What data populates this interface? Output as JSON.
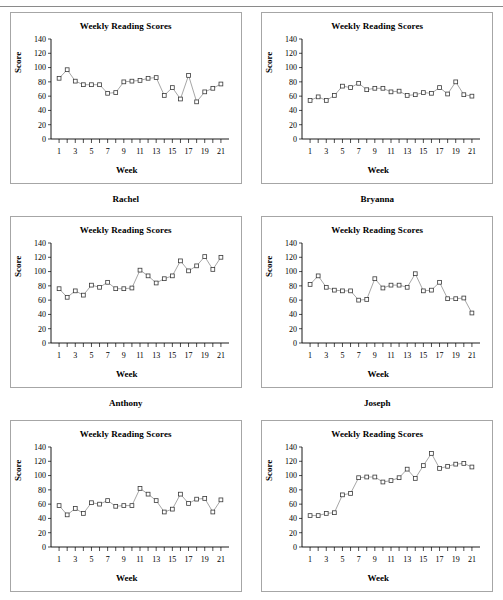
{
  "page": {
    "top_rule": true,
    "columns": 2,
    "rows": 3
  },
  "axes": {
    "ylabel": "Score",
    "xlabel": "Week",
    "y_ticks": [
      0,
      20,
      40,
      60,
      80,
      100,
      120,
      140
    ],
    "ylim": [
      0,
      140
    ],
    "x_ticks_labeled": [
      1,
      3,
      5,
      7,
      9,
      11,
      13,
      15,
      17,
      19,
      21
    ],
    "x_ticks_all": [
      1,
      2,
      3,
      4,
      5,
      6,
      7,
      8,
      9,
      10,
      11,
      12,
      13,
      14,
      15,
      16,
      17,
      18,
      19,
      20,
      21
    ],
    "xlim": [
      0,
      22
    ],
    "grid": false,
    "legend": "none",
    "line_color": "#808080",
    "marker_color": "#3a3a3a",
    "marker_fill": "#ffffff",
    "panel_border_color": "#a6a6a6"
  },
  "chart_data": [
    {
      "type": "line",
      "title": "Weekly Reading Scores",
      "name_label": "Rachel",
      "xlabel": "Week",
      "ylabel": "Score",
      "ylim": [
        0,
        140
      ],
      "x": [
        1,
        2,
        3,
        4,
        5,
        6,
        7,
        8,
        9,
        10,
        11,
        12,
        13,
        14,
        15,
        16,
        17,
        18,
        19,
        20,
        21
      ],
      "values": [
        85,
        97,
        81,
        76,
        76,
        76,
        64,
        65,
        80,
        81,
        82,
        85,
        86,
        61,
        72,
        56,
        89,
        52,
        66,
        71,
        77
      ]
    },
    {
      "type": "line",
      "title": "Weekly Reading Scores",
      "name_label": "Bryanna",
      "xlabel": "Week",
      "ylabel": "Score",
      "ylim": [
        0,
        140
      ],
      "x": [
        1,
        2,
        3,
        4,
        5,
        6,
        7,
        8,
        9,
        10,
        11,
        12,
        13,
        14,
        15,
        16,
        17,
        18,
        19,
        20
      ],
      "values": [
        54,
        59,
        54,
        61,
        74,
        72,
        78,
        69,
        71,
        71,
        66,
        67,
        61,
        62,
        65,
        64,
        72,
        63,
        80,
        62,
        60
      ]
    },
    {
      "type": "line",
      "title": "Weekly Reading Scores",
      "name_label": "Anthony",
      "xlabel": "Week",
      "ylabel": "Score",
      "ylim": [
        0,
        140
      ],
      "x": [
        1,
        2,
        3,
        4,
        5,
        6,
        7,
        8,
        9,
        10,
        11,
        12,
        13,
        14,
        15,
        16,
        17,
        18,
        19,
        20
      ],
      "values": [
        76,
        64,
        73,
        67,
        81,
        78,
        85,
        76,
        76,
        77,
        102,
        94,
        84,
        90,
        94,
        115,
        101,
        108,
        121,
        103,
        120
      ]
    },
    {
      "type": "line",
      "title": "Weekly Reading Scores",
      "name_label": "Joseph",
      "xlabel": "Week",
      "ylabel": "Score",
      "ylim": [
        0,
        140
      ],
      "x": [
        1,
        2,
        3,
        4,
        5,
        6,
        7,
        8,
        9,
        10,
        11,
        12,
        13,
        14,
        15,
        16,
        17,
        18,
        19,
        20,
        21
      ],
      "values": [
        82,
        94,
        78,
        74,
        73,
        73,
        60,
        61,
        90,
        77,
        81,
        81,
        78,
        97,
        73,
        74,
        85,
        62,
        62,
        63,
        42
      ]
    },
    {
      "type": "line",
      "title": "Weekly Reading Scores",
      "name_label": "",
      "xlabel": "Week",
      "ylabel": "Score",
      "ylim": [
        0,
        140
      ],
      "x": [
        1,
        2,
        3,
        4,
        5,
        6,
        7,
        8,
        9,
        10,
        11,
        12,
        13,
        14,
        15,
        16,
        17,
        18,
        19,
        20,
        21
      ],
      "values": [
        58,
        45,
        54,
        47,
        62,
        60,
        65,
        57,
        58,
        58,
        82,
        74,
        65,
        49,
        53,
        74,
        61,
        67,
        68,
        49,
        66
      ]
    },
    {
      "type": "line",
      "title": "Weekly Reading Scores",
      "name_label": "",
      "xlabel": "Week",
      "ylabel": "Score",
      "ylim": [
        0,
        140
      ],
      "x": [
        1,
        2,
        3,
        4,
        5,
        6,
        7,
        8,
        9,
        10,
        11,
        12,
        13,
        14,
        15,
        16,
        17,
        18,
        19,
        20,
        21
      ],
      "values": [
        44,
        44,
        47,
        48,
        73,
        75,
        97,
        98,
        98,
        91,
        93,
        97,
        109,
        96,
        114,
        131,
        110,
        113,
        116,
        117,
        112
      ]
    }
  ]
}
